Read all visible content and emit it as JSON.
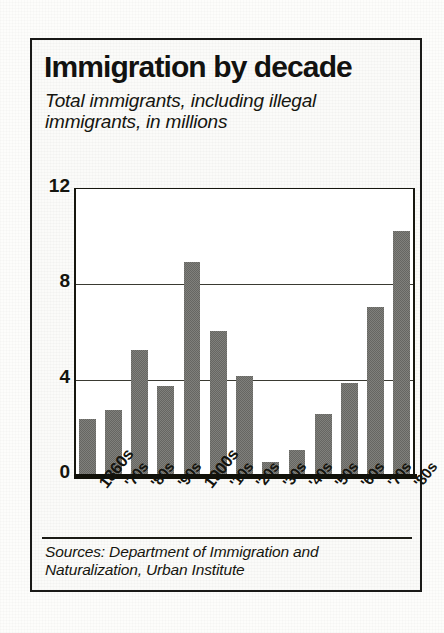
{
  "figure": {
    "title": "Immigration by decade",
    "subtitle": "Total immigrants, including illegal immigrants, in millions",
    "source": "Sources: Department of Immigration and Naturalization, Urban Institute",
    "ink_color": "#14140e",
    "bar_color": "#2b2b25",
    "paper_color": "#fbfbf9"
  },
  "chart_data": {
    "type": "bar",
    "title": "Immigration by decade",
    "subtitle": "Total immigrants, including illegal immigrants, in millions",
    "xlabel": "",
    "ylabel": "",
    "ylim": [
      0,
      12
    ],
    "yticks": [
      0,
      4,
      8,
      12
    ],
    "gridlines": [
      4,
      8
    ],
    "grid": true,
    "legend": false,
    "units": "millions",
    "categories": [
      "1860s",
      "'70s",
      "'80s",
      "'90s",
      "1900s",
      "'10s",
      "'20s",
      "'30s",
      "'40s",
      "'50s",
      "'60s",
      "'70s",
      "'80s"
    ],
    "emphasized_categories": [
      "1860s",
      "1900s"
    ],
    "values": [
      2.3,
      2.7,
      5.2,
      3.7,
      8.9,
      6.0,
      4.1,
      0.5,
      1.0,
      2.5,
      3.8,
      7.0,
      10.2
    ],
    "source": "Sources: Department of Immigration and Naturalization, Urban Institute"
  }
}
